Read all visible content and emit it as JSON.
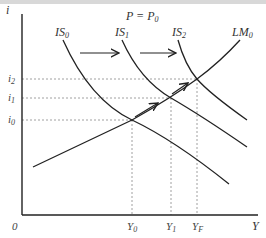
{
  "diagram": {
    "title_condition": {
      "main": "P = P",
      "sub": "0"
    },
    "axes": {
      "y_label": "i",
      "x_label": "Y",
      "origin_label": "0"
    },
    "curves": [
      {
        "id": "IS0",
        "label": "IS",
        "sub": "0"
      },
      {
        "id": "IS1",
        "label": "IS",
        "sub": "1"
      },
      {
        "id": "IS2",
        "label": "IS",
        "sub": "2"
      },
      {
        "id": "LM0",
        "label": "LM",
        "sub": "0"
      }
    ],
    "y_ticks": [
      {
        "label": "i",
        "sub": "2"
      },
      {
        "label": "i",
        "sub": "1"
      },
      {
        "label": "i",
        "sub": "0"
      }
    ],
    "x_ticks": [
      {
        "label": "Y",
        "sub": "0"
      },
      {
        "label": "Y",
        "sub": "1"
      },
      {
        "label": "Y",
        "sub": "F"
      }
    ],
    "colors": {
      "line": "#222222",
      "dashed": "#888888"
    }
  }
}
